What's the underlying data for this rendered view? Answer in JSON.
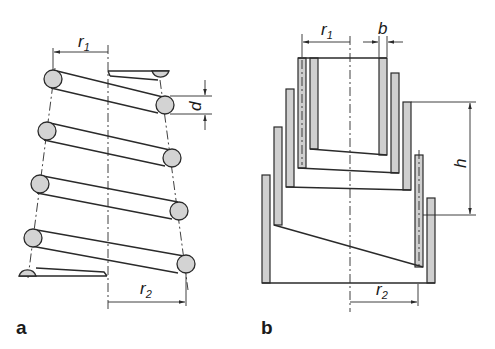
{
  "figure": {
    "panel_a": {
      "label": "a",
      "description": "Conical compression spring with round wire",
      "dimensions": {
        "r1": {
          "symbol": "r",
          "subscript": "1"
        },
        "r2": {
          "symbol": "r",
          "subscript": "2"
        },
        "d": {
          "symbol": "d"
        }
      }
    },
    "panel_b": {
      "label": "b",
      "description": "Volute (telescoping) spring with rectangular section strip",
      "dimensions": {
        "r1": {
          "symbol": "r",
          "subscript": "1"
        },
        "r2": {
          "symbol": "r",
          "subscript": "2"
        },
        "b": {
          "symbol": "b"
        },
        "h": {
          "symbol": "h"
        }
      }
    },
    "colors": {
      "line": "#2a2a2a",
      "fill": "#d3d3d3",
      "background": "#ffffff"
    }
  }
}
